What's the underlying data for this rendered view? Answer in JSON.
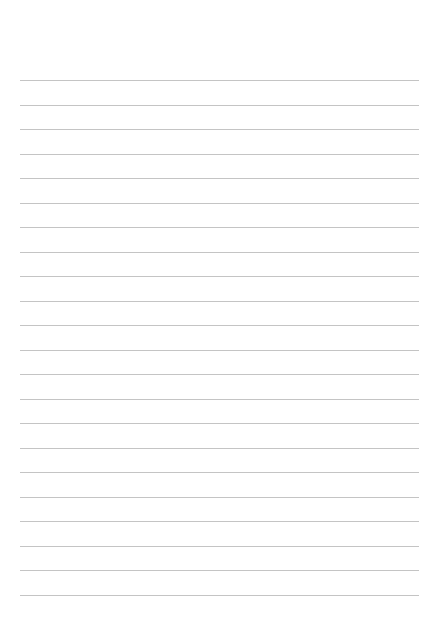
{
  "page": {
    "type": "lined-paper",
    "background_color": "#ffffff",
    "rule_color": "#c4c4c4",
    "rule_count": 22,
    "rule_left": 20,
    "rule_right": 419,
    "first_rule_y": 80,
    "rule_spacing": 24.5,
    "lines": [
      "",
      "",
      "",
      "",
      "",
      "",
      "",
      "",
      "",
      "",
      "",
      "",
      "",
      "",
      "",
      "",
      "",
      "",
      "",
      "",
      "",
      ""
    ]
  }
}
